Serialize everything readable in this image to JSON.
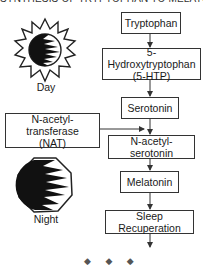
{
  "title": "SYNTHESIS OF TRYPTOPHAN TO MELATONIN",
  "pathway": {
    "steps": [
      {
        "label": "Tryptophan"
      },
      {
        "label": "5-Hydroxytryptophan",
        "sublabel": "(5-HTP)"
      },
      {
        "label": "Serotonin"
      },
      {
        "label": "N-acetyl-serotonin"
      },
      {
        "label": "Melatonin"
      },
      {
        "label": "Sleep Recuperation"
      }
    ],
    "enzyme": {
      "label": "N-acetyl-transferase",
      "sublabel": "(NAT)"
    }
  },
  "icons": {
    "day": {
      "icon": "sun-icon",
      "label": "Day"
    },
    "night": {
      "icon": "moon-icon",
      "label": "Night"
    }
  },
  "footer": {
    "ornament": "◆ ◆ ◆"
  },
  "colors": {
    "line": "#333333",
    "text": "#1a1a1a",
    "background": "#ffffff"
  }
}
